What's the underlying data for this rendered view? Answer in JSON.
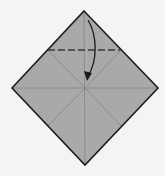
{
  "diagram": {
    "type": "origami-fold-step",
    "colors": {
      "background": "#f4f4f4",
      "paper": "#a9a9a9",
      "outline": "#1e1e1e",
      "crease": "#8c8c8c",
      "fold_line": "#3a3a3a",
      "arrow": "#1a1a1a"
    },
    "paper": {
      "vertices": {
        "top": [
          84,
          11
        ],
        "right": [
          158,
          88
        ],
        "bottom": [
          85,
          165
        ],
        "left": [
          12,
          88
        ]
      },
      "center": [
        85,
        88
      ]
    },
    "creases": [
      {
        "name": "horizontal",
        "from": [
          12,
          88
        ],
        "to": [
          158,
          88
        ]
      },
      {
        "name": "vertical",
        "from": [
          84,
          11
        ],
        "to": [
          85,
          165
        ]
      },
      {
        "name": "upper-left",
        "from": [
          48,
          50
        ],
        "to": [
          85,
          88
        ]
      },
      {
        "name": "upper-right",
        "from": [
          121,
          50
        ],
        "to": [
          85,
          88
        ]
      },
      {
        "name": "lower-left",
        "from": [
          48,
          126
        ],
        "to": [
          85,
          88
        ]
      },
      {
        "name": "lower-right",
        "from": [
          121,
          126
        ],
        "to": [
          85,
          88
        ]
      }
    ],
    "fold_line": {
      "style": "dashed",
      "from": [
        48,
        50
      ],
      "to": [
        120,
        50
      ]
    },
    "arrow": {
      "direction": "down",
      "start": [
        88,
        20
      ],
      "end": [
        87,
        80
      ],
      "label": "fold top corner to center"
    }
  }
}
